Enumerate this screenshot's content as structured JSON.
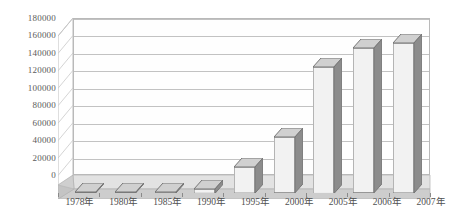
{
  "chart_data": {
    "type": "bar",
    "title": "",
    "subtitle": "",
    "xlabel": "",
    "ylabel": "",
    "categories": [
      "1978年",
      "1980年",
      "1985年",
      "1990年",
      "1995年",
      "2000年",
      "2005年",
      "2006年",
      "2007年"
    ],
    "values": [
      500,
      700,
      1200,
      5000,
      30000,
      64000,
      145000,
      166000,
      172000
    ],
    "series": [
      {
        "name": "",
        "values": [
          500,
          700,
          1200,
          5000,
          30000,
          64000,
          145000,
          166000,
          172000
        ]
      }
    ],
    "ylim": [
      0,
      180000
    ],
    "yticks": [
      0,
      20000,
      40000,
      60000,
      80000,
      100000,
      120000,
      140000,
      160000,
      180000
    ],
    "ytick_labels": [
      "0",
      "20000",
      "40000",
      "60000",
      "80000",
      "100000",
      "120000",
      "140000",
      "160000",
      "180000"
    ],
    "grid": true,
    "grid_axis": "y",
    "legend": false,
    "legend_position": "none",
    "three_d": true,
    "annotations": []
  },
  "style": {
    "bar_front_color": "#f2f2f2",
    "bar_side_color": "#8c8c8c",
    "bar_top_color": "#d0d0d0",
    "bar_outline_color": "#767676",
    "gridline_color": "#c2c2c2",
    "frame_color": "#b9b9b9",
    "floor_color": "#c9c9c9",
    "floor_top_color": "#d8d8d8",
    "axis_text_color": "#5b5b5b",
    "background_color": "#ffffff"
  }
}
